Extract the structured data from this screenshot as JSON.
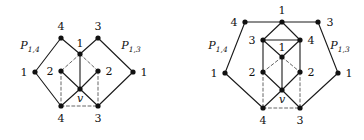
{
  "figure": {
    "colors": {
      "stroke": "#1a1a1a",
      "node": "#111111",
      "background": "#ffffff",
      "dashed": "#555555"
    },
    "node_radius": 2.6,
    "stroke_width": 1.1
  },
  "left_graph": {
    "name": "left-diamond-graph",
    "path_labels": [
      {
        "name": "path-label-p14",
        "base": "P",
        "sub": "1,4",
        "x": 30,
        "y": 47
      },
      {
        "name": "path-label-p13",
        "base": "P",
        "sub": "1,3",
        "x": 131,
        "y": 47
      }
    ],
    "nodes": [
      {
        "id": "L-left-1",
        "label": "1",
        "x": 35,
        "y": 72,
        "lx": 24,
        "ly": 72,
        "italic": false
      },
      {
        "id": "L-top-4",
        "label": "4",
        "x": 61,
        "y": 38,
        "lx": 61,
        "ly": 26,
        "italic": false
      },
      {
        "id": "L-top-3",
        "label": "3",
        "x": 98,
        "y": 38,
        "lx": 98,
        "ly": 26,
        "italic": false
      },
      {
        "id": "L-right-1",
        "label": "1",
        "x": 133,
        "y": 72,
        "lx": 144,
        "ly": 72,
        "italic": false
      },
      {
        "id": "L-center-1",
        "label": "1",
        "x": 80,
        "y": 54,
        "lx": 80,
        "ly": 43,
        "italic": false
      },
      {
        "id": "L-left-2",
        "label": "2",
        "x": 61,
        "y": 71,
        "lx": 50,
        "ly": 71,
        "italic": false
      },
      {
        "id": "L-right-2",
        "label": "2",
        "x": 98,
        "y": 71,
        "lx": 109,
        "ly": 71,
        "italic": false
      },
      {
        "id": "L-v",
        "label": "v",
        "x": 80,
        "y": 89,
        "lx": 80,
        "ly": 98,
        "italic": true
      },
      {
        "id": "L-bot-4",
        "label": "4",
        "x": 61,
        "y": 106,
        "lx": 61,
        "ly": 118,
        "italic": false
      },
      {
        "id": "L-bot-3",
        "label": "3",
        "x": 98,
        "y": 106,
        "lx": 98,
        "ly": 118,
        "italic": false
      }
    ],
    "solid_edges": [
      [
        "L-left-1",
        "L-top-4"
      ],
      [
        "L-top-4",
        "L-center-1"
      ],
      [
        "L-center-1",
        "L-top-3"
      ],
      [
        "L-top-3",
        "L-right-1"
      ],
      [
        "L-left-1",
        "L-bot-4"
      ],
      [
        "L-right-1",
        "L-bot-3"
      ],
      [
        "L-center-1",
        "L-v"
      ],
      [
        "L-left-2",
        "L-v"
      ],
      [
        "L-right-2",
        "L-v"
      ],
      [
        "L-bot-4",
        "L-v"
      ],
      [
        "L-bot-3",
        "L-v"
      ]
    ],
    "dashed_edges": [
      [
        "L-center-1",
        "L-left-2"
      ],
      [
        "L-center-1",
        "L-right-2"
      ],
      [
        "L-left-2",
        "L-bot-4"
      ],
      [
        "L-right-2",
        "L-bot-3"
      ],
      [
        "L-bot-4",
        "L-bot-3"
      ]
    ]
  },
  "right_graph": {
    "name": "right-pentagon-graph",
    "path_labels": [
      {
        "name": "path-label-p14",
        "base": "P",
        "sub": "1,4",
        "x": 218,
        "y": 47
      },
      {
        "name": "path-label-p13",
        "base": "P",
        "sub": "1,3",
        "x": 340,
        "y": 47
      }
    ],
    "nodes": [
      {
        "id": "R-top-4",
        "label": "4",
        "x": 245,
        "y": 22,
        "lx": 234,
        "ly": 22,
        "italic": false
      },
      {
        "id": "R-top-1",
        "label": "1",
        "x": 282,
        "y": 22,
        "lx": 282,
        "ly": 10,
        "italic": false
      },
      {
        "id": "R-top-3",
        "label": "3",
        "x": 318,
        "y": 22,
        "lx": 330,
        "ly": 22,
        "italic": false
      },
      {
        "id": "R-in-3",
        "label": "3",
        "x": 263,
        "y": 40,
        "lx": 252,
        "ly": 40,
        "italic": false
      },
      {
        "id": "R-in-4",
        "label": "4",
        "x": 300,
        "y": 40,
        "lx": 311,
        "ly": 40,
        "italic": false
      },
      {
        "id": "R-center-1",
        "label": "1",
        "x": 282,
        "y": 57,
        "lx": 282,
        "ly": 47,
        "italic": false
      },
      {
        "id": "R-left-1",
        "label": "1",
        "x": 225,
        "y": 73,
        "lx": 214,
        "ly": 73,
        "italic": false
      },
      {
        "id": "R-right-1",
        "label": "1",
        "x": 338,
        "y": 73,
        "lx": 349,
        "ly": 73,
        "italic": false
      },
      {
        "id": "R-left-2",
        "label": "2",
        "x": 263,
        "y": 72,
        "lx": 252,
        "ly": 72,
        "italic": false
      },
      {
        "id": "R-right-2",
        "label": "2",
        "x": 300,
        "y": 72,
        "lx": 311,
        "ly": 72,
        "italic": false
      },
      {
        "id": "R-v",
        "label": "v",
        "x": 282,
        "y": 90,
        "lx": 282,
        "ly": 99,
        "italic": true
      },
      {
        "id": "R-bot-4",
        "label": "4",
        "x": 263,
        "y": 108,
        "lx": 263,
        "ly": 120,
        "italic": false
      },
      {
        "id": "R-bot-3",
        "label": "3",
        "x": 300,
        "y": 108,
        "lx": 300,
        "ly": 120,
        "italic": false
      }
    ],
    "solid_edges": [
      [
        "R-top-4",
        "R-top-1"
      ],
      [
        "R-top-1",
        "R-top-3"
      ],
      [
        "R-top-4",
        "R-left-1"
      ],
      [
        "R-top-3",
        "R-right-1"
      ],
      [
        "R-left-1",
        "R-bot-4"
      ],
      [
        "R-right-1",
        "R-bot-3"
      ],
      [
        "R-top-1",
        "R-in-3"
      ],
      [
        "R-top-1",
        "R-in-4"
      ],
      [
        "R-in-3",
        "R-in-4"
      ],
      [
        "R-in-3",
        "R-center-1"
      ],
      [
        "R-in-4",
        "R-center-1"
      ],
      [
        "R-in-3",
        "R-left-2"
      ],
      [
        "R-in-4",
        "R-right-2"
      ],
      [
        "R-center-1",
        "R-v"
      ],
      [
        "R-left-2",
        "R-v"
      ],
      [
        "R-right-2",
        "R-v"
      ],
      [
        "R-bot-4",
        "R-v"
      ],
      [
        "R-bot-3",
        "R-v"
      ]
    ],
    "dashed_edges": [
      [
        "R-center-1",
        "R-left-2"
      ],
      [
        "R-center-1",
        "R-right-2"
      ],
      [
        "R-left-2",
        "R-bot-4"
      ],
      [
        "R-right-2",
        "R-bot-3"
      ],
      [
        "R-bot-4",
        "R-bot-3"
      ]
    ]
  }
}
